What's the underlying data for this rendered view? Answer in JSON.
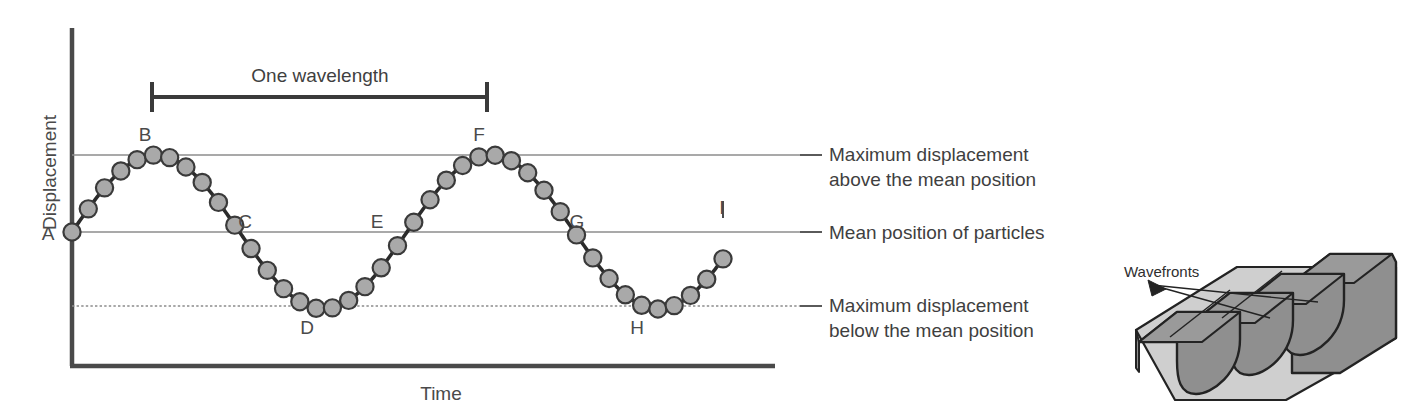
{
  "figure": {
    "kind": "physics-wave-diagram",
    "background_color": "#ffffff"
  },
  "graph": {
    "y_axis_title": "Displacement",
    "x_axis_title": "Time",
    "wavelength_bracket_label": "One wavelength",
    "axis_color": "#4a4a4a",
    "reference_line_color": "#8c8c8c",
    "curve_color": "#2b2b2b",
    "particle_fill": "#a9a9a9",
    "particle_stroke": "#3a3a3a",
    "point_labels": [
      {
        "id": "A",
        "label": "A",
        "x": 72,
        "y": 232,
        "tx": 48,
        "ty": 240
      },
      {
        "id": "B",
        "label": "B",
        "x": 152,
        "y": 155,
        "tx": 145,
        "ty": 141
      },
      {
        "id": "C",
        "label": "C",
        "x": 235,
        "y": 232,
        "tx": 245,
        "ty": 228
      },
      {
        "id": "D",
        "label": "D",
        "x": 315,
        "y": 306,
        "tx": 307,
        "ty": 334
      },
      {
        "id": "E",
        "label": "E",
        "x": 400,
        "y": 232,
        "tx": 377,
        "ty": 228
      },
      {
        "id": "F",
        "label": "F",
        "x": 487,
        "y": 155,
        "tx": 479,
        "ty": 141
      },
      {
        "id": "G",
        "label": "G",
        "x": 570,
        "y": 232,
        "tx": 577,
        "ty": 228
      },
      {
        "id": "H",
        "label": "H",
        "x": 645,
        "y": 306,
        "tx": 637,
        "ty": 334
      },
      {
        "id": "I",
        "label": "I",
        "x": 723,
        "y": 232,
        "tx": 722,
        "ty": 214
      }
    ],
    "reference_lines": [
      {
        "id": "max-above",
        "y": 155,
        "label_line_1": "Maximum displacement",
        "label_line_2": "above the mean position"
      },
      {
        "id": "mean",
        "y": 232,
        "label_line_1": "Mean position of particles",
        "label_line_2": ""
      },
      {
        "id": "max-below",
        "y": 306,
        "label_line_1": "Maximum displacement",
        "label_line_2": "below the mean position"
      }
    ]
  },
  "chart_data": {
    "type": "line",
    "title": "",
    "xlabel": "Time",
    "ylabel": "Displacement",
    "grid": false,
    "legend": "none",
    "amplitude_px": 77,
    "wavelength_px": 335,
    "mean_level_px": 232,
    "x_start_px": 72,
    "x_end_px": 723,
    "n_particles": 41,
    "phase": "sine starting at zero going upward at A",
    "annotations": [
      {
        "text": "One wavelength",
        "from_x": 152,
        "to_x": 487,
        "y": 97
      },
      {
        "text": "Maximum displacement above the mean position",
        "at_y": 155
      },
      {
        "text": "Mean position of particles",
        "at_y": 232
      },
      {
        "text": "Maximum displacement below the mean position",
        "at_y": 306
      }
    ],
    "marked_points": [
      {
        "label": "A",
        "time": 0.0,
        "displacement": 0
      },
      {
        "label": "B",
        "time": 0.25,
        "displacement": 1
      },
      {
        "label": "C",
        "time": 0.5,
        "displacement": 0
      },
      {
        "label": "D",
        "time": 0.75,
        "displacement": -1
      },
      {
        "label": "E",
        "time": 1.0,
        "displacement": 0
      },
      {
        "label": "F",
        "time": 1.25,
        "displacement": 1
      },
      {
        "label": "G",
        "time": 1.5,
        "displacement": 0
      },
      {
        "label": "H",
        "time": 1.75,
        "displacement": -1
      },
      {
        "label": "I",
        "time": 2.0,
        "displacement": 0
      }
    ]
  },
  "wavefronts_illustration": {
    "label": "Wavefronts",
    "ridge_top_color": "#8f8f8f",
    "ridge_side_color": "#7c7c7c",
    "cross_section_color": "#cfcfcf",
    "outline_color": "#232323",
    "ridge_count": 4
  }
}
